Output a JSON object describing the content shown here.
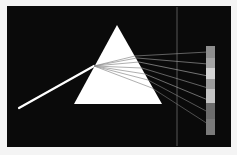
{
  "diagram": {
    "title": "",
    "colors": {
      "background": "#0a0a0a",
      "page": "#f4f4f4",
      "prism": "#ffffff",
      "beam": "#ffffff",
      "divider": "#6a6a6a"
    },
    "prism": {
      "apex": [
        117,
        25
      ],
      "base_left": [
        74,
        104
      ],
      "base_right": [
        162,
        104
      ]
    },
    "incident_beam": {
      "from": [
        19,
        108
      ],
      "to": [
        94,
        66
      ]
    },
    "rays": [
      {
        "exit": [
          135,
          56
        ],
        "screen": [
          208,
          52
        ],
        "color": "#9a9a9a"
      },
      {
        "exit": [
          137,
          58
        ],
        "screen": [
          208,
          64
        ],
        "color": "#a8a8a8"
      },
      {
        "exit": [
          139,
          62
        ],
        "screen": [
          208,
          76
        ],
        "color": "#b8b8b8"
      },
      {
        "exit": [
          142,
          68
        ],
        "screen": [
          208,
          88
        ],
        "color": "#9e9e9e"
      },
      {
        "exit": [
          145,
          74
        ],
        "screen": [
          208,
          100
        ],
        "color": "#b0b0b0"
      },
      {
        "exit": [
          148,
          80
        ],
        "screen": [
          208,
          112
        ],
        "color": "#8a8a8a"
      },
      {
        "exit": [
          152,
          88
        ],
        "screen": [
          208,
          124
        ],
        "color": "#7c7c7c"
      }
    ],
    "spectrum_bar": {
      "x": 206,
      "y": 46,
      "width": 9,
      "bands": [
        "#8e8e8e",
        "#a4a4a4",
        "#d4d4d4",
        "#9c9c9c",
        "#c4c4c4",
        "#6c6c6c",
        "#7a7a7a"
      ],
      "band_heights": [
        12,
        10,
        11,
        10,
        14,
        16,
        16
      ]
    },
    "divider_x": 177
  }
}
